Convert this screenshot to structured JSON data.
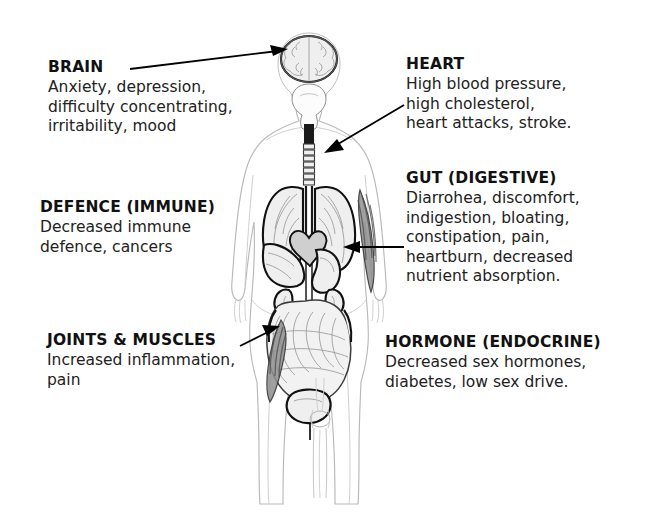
{
  "diagram": {
    "background_color": "#ffffff",
    "text_color": "#1a1a1a",
    "accent_color": "#000000"
  },
  "labels": {
    "brain": {
      "heading": "BRAIN",
      "body": "Anxiety, depression,\ndifficulty concentrating,\nirritability, mood"
    },
    "defence": {
      "heading": "DEFENCE (IMMUNE)",
      "body": "Decreased immune\ndefence, cancers"
    },
    "joints": {
      "heading": "JOINTS & MUSCLES",
      "body": "Increased inflammation,\npain"
    },
    "heart": {
      "heading": "HEART",
      "body": "High blood pressure,\nhigh cholesterol,\nheart attacks, stroke."
    },
    "gut": {
      "heading": "GUT (DIGESTIVE)",
      "body": "Diarrohea, discomfort,\nindigestion, bloating,\nconstipation, pain,\nheartburn, decreased\nnutrient absorption."
    },
    "hormone": {
      "heading": "HORMONE (ENDOCRINE)",
      "body": "Decreased sex hormones,\ndiabetes, low sex drive."
    }
  },
  "figure": {
    "parts": [
      "brain",
      "skull",
      "jaw",
      "spine",
      "lungs",
      "heart",
      "liver",
      "stomach",
      "kidneys",
      "intestines",
      "bladder",
      "arm-muscles",
      "thigh-muscles",
      "knee-joint",
      "leg-bones"
    ]
  },
  "pointers": [
    {
      "name": "brain-pointer",
      "from": [
        130,
        68
      ],
      "to": [
        286,
        50
      ]
    },
    {
      "name": "heart-pointer",
      "from": [
        402,
        106
      ],
      "to": [
        325,
        152
      ]
    },
    {
      "name": "gut-pointer",
      "from": [
        402,
        247
      ],
      "to": [
        344,
        247
      ]
    },
    {
      "name": "joints-pointer",
      "from": [
        243,
        344
      ],
      "to": [
        279,
        327
      ]
    }
  ]
}
